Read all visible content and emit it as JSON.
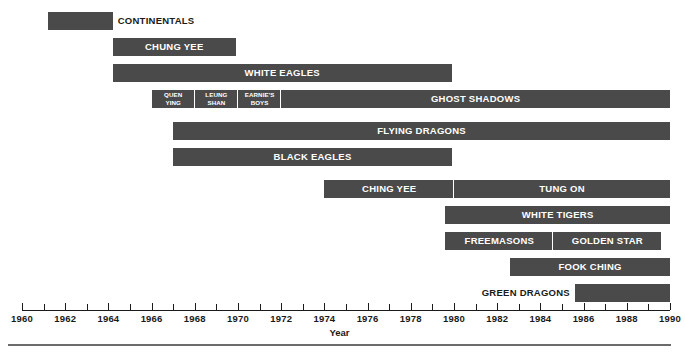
{
  "figure": {
    "axis_title": "Year",
    "caption_prefix": "FIGURE 6-1",
    "caption_text": "Timeline of New York Chinese Gangs"
  },
  "chart_data": {
    "type": "bar",
    "orientation": "horizontal",
    "subtype": "gantt-timeline",
    "title": "",
    "xlabel": "Year",
    "ylabel": "",
    "xlim": [
      1960,
      1990
    ],
    "grid": false,
    "legend": false,
    "bar_color": "#4a4a4a",
    "label_color_inside": "#ffffff",
    "label_color_outside": "#1a1a1a",
    "xticks": [
      1960,
      1962,
      1964,
      1966,
      1968,
      1970,
      1972,
      1974,
      1976,
      1978,
      1980,
      1982,
      1984,
      1986,
      1988,
      1990
    ],
    "xtick_labels": [
      "1960",
      "1962",
      "1964",
      "1966",
      "1968",
      "1970",
      "1972",
      "1974",
      "1976",
      "1978",
      "1980",
      "1982",
      "1984",
      "1986",
      "1988",
      "1990"
    ],
    "minor_ticks": [
      1961,
      1963,
      1965,
      1967,
      1969,
      1971,
      1973,
      1975,
      1977,
      1979,
      1981,
      1983,
      1985,
      1987,
      1989
    ],
    "rows": [
      {
        "index": 0,
        "segments": [
          {
            "label": "CONTINENTALS",
            "start": 1961.2,
            "end": 1964.2,
            "label_position": "outside-right"
          }
        ]
      },
      {
        "index": 1,
        "segments": [
          {
            "label": "CHUNG YEE",
            "start": 1964.2,
            "end": 1969.9,
            "label_position": "inside"
          }
        ]
      },
      {
        "index": 2,
        "segments": [
          {
            "label": "WHITE EAGLES",
            "start": 1964.2,
            "end": 1979.9,
            "label_position": "inside"
          }
        ]
      },
      {
        "index": 3,
        "segments": [
          {
            "label": "QUEN YING",
            "label_lines": [
              "QUEN",
              "YING"
            ],
            "start": 1966.0,
            "end": 1968.0,
            "label_position": "inside-small"
          },
          {
            "label": "LEUNG SHAN",
            "label_lines": [
              "LEUNG",
              "SHAN"
            ],
            "start": 1968.0,
            "end": 1970.0,
            "label_position": "inside-small"
          },
          {
            "label": "EARNIE'S BOYS",
            "label_lines": [
              "EARNIE'S",
              "BOYS"
            ],
            "start": 1970.0,
            "end": 1972.0,
            "label_position": "inside-small"
          },
          {
            "label": "GHOST SHADOWS",
            "start": 1972.0,
            "end": 1990.0,
            "label_position": "inside"
          }
        ]
      },
      {
        "index": 4,
        "segments": [
          {
            "label": "FLYING DRAGONS",
            "start": 1967.0,
            "end": 1990.0,
            "label_position": "inside"
          }
        ]
      },
      {
        "index": 5,
        "segments": [
          {
            "label": "BLACK EAGLES",
            "start": 1967.0,
            "end": 1979.9,
            "label_position": "inside"
          }
        ]
      },
      {
        "index": 6,
        "segments": [
          {
            "label": "CHING YEE",
            "start": 1974.0,
            "end": 1980.0,
            "label_position": "inside"
          },
          {
            "label": "TUNG ON",
            "start": 1980.0,
            "end": 1990.0,
            "label_position": "inside"
          }
        ]
      },
      {
        "index": 7,
        "segments": [
          {
            "label": "WHITE TIGERS",
            "start": 1979.6,
            "end": 1990.0,
            "label_position": "inside"
          }
        ]
      },
      {
        "index": 8,
        "segments": [
          {
            "label": "FREEMASONS",
            "start": 1979.6,
            "end": 1984.6,
            "label_position": "inside"
          },
          {
            "label": "GOLDEN STAR",
            "start": 1984.6,
            "end": 1989.6,
            "label_position": "inside"
          }
        ]
      },
      {
        "index": 9,
        "segments": [
          {
            "label": "FOOK CHING",
            "start": 1982.6,
            "end": 1990.0,
            "label_position": "inside"
          }
        ]
      },
      {
        "index": 10,
        "segments": [
          {
            "label": "GREEN DRAGONS",
            "start": 1985.6,
            "end": 1990.0,
            "label_position": "outside-left"
          }
        ]
      }
    ]
  }
}
